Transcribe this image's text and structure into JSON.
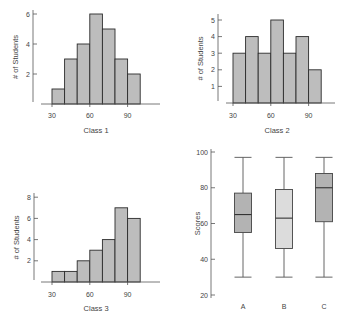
{
  "chart_data": [
    {
      "type": "bar",
      "subtype": "histogram",
      "title": "Class 1",
      "xlabel": "Class 1",
      "ylabel": "# of Students",
      "bins": [
        [
          30,
          40
        ],
        [
          40,
          50
        ],
        [
          50,
          60
        ],
        [
          60,
          70
        ],
        [
          70,
          80
        ],
        [
          80,
          90
        ],
        [
          90,
          100
        ]
      ],
      "values": [
        1,
        3,
        4,
        6,
        5,
        3,
        2
      ],
      "xticks": [
        "30",
        "60",
        "90"
      ],
      "yticks": [
        "2",
        "4",
        "6"
      ],
      "ylim": [
        0,
        6
      ],
      "grid": false
    },
    {
      "type": "bar",
      "subtype": "histogram",
      "title": "Class 2",
      "xlabel": "Class 2",
      "ylabel": "# of Students",
      "bins": [
        [
          30,
          40
        ],
        [
          40,
          50
        ],
        [
          50,
          60
        ],
        [
          60,
          70
        ],
        [
          70,
          80
        ],
        [
          80,
          90
        ],
        [
          90,
          100
        ]
      ],
      "values": [
        3,
        4,
        3,
        5,
        3,
        4,
        2
      ],
      "xticks": [
        "30",
        "60",
        "90"
      ],
      "yticks": [
        "1",
        "2",
        "3",
        "4",
        "5"
      ],
      "ylim": [
        0,
        5
      ],
      "grid": false
    },
    {
      "type": "bar",
      "subtype": "histogram",
      "title": "Class 3",
      "xlabel": "Class 3",
      "ylabel": "# of Students",
      "bins": [
        [
          30,
          40
        ],
        [
          40,
          50
        ],
        [
          50,
          60
        ],
        [
          60,
          70
        ],
        [
          70,
          80
        ],
        [
          80,
          90
        ],
        [
          90,
          100
        ]
      ],
      "values": [
        1,
        1,
        2,
        3,
        4,
        7,
        6
      ],
      "xticks": [
        "30",
        "60",
        "90"
      ],
      "yticks": [
        "2",
        "4",
        "6",
        "8"
      ],
      "ylim": [
        0,
        8
      ],
      "grid": false
    },
    {
      "type": "boxplot",
      "title": "",
      "xlabel": "",
      "ylabel": "Scores",
      "categories": [
        "A",
        "B",
        "C"
      ],
      "boxes": [
        {
          "name": "A",
          "min": 30,
          "q1": 55,
          "median": 65,
          "q3": 77,
          "max": 97,
          "color": "#b3b3b3"
        },
        {
          "name": "B",
          "min": 30,
          "q1": 46,
          "median": 63,
          "q3": 79,
          "max": 97,
          "color": "#dcdcdc"
        },
        {
          "name": "C",
          "min": 30,
          "q1": 61,
          "median": 80,
          "q3": 88,
          "max": 97,
          "color": "#b3b3b3"
        }
      ],
      "yticks": [
        "20",
        "40",
        "60",
        "80",
        "100"
      ],
      "ylim": [
        20,
        100
      ],
      "grid": false
    }
  ],
  "colors": {
    "bar_fill": "#bdbdbd",
    "bar_stroke": "#2b2b2b",
    "axis": "#555555"
  }
}
